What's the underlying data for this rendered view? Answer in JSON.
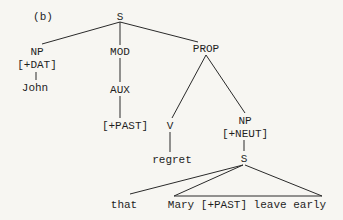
{
  "figure": {
    "panel_label": "(b)",
    "type": "syntactic-tree"
  },
  "nodes": {
    "root": {
      "label": "S",
      "x": 120,
      "y": 20
    },
    "np_dat": {
      "label": "NP",
      "x": 37,
      "y": 54
    },
    "np_dat_feat": {
      "label": "[+DAT]",
      "x": 37,
      "y": 67
    },
    "john": {
      "label": "John",
      "x": 35,
      "y": 90
    },
    "mod": {
      "label": "MOD",
      "x": 120,
      "y": 54
    },
    "aux": {
      "label": "AUX",
      "x": 120,
      "y": 92
    },
    "past": {
      "label": "[+PAST]",
      "x": 125,
      "y": 128
    },
    "prop": {
      "label": "PROP",
      "x": 206,
      "y": 50
    },
    "v": {
      "label": "V",
      "x": 170,
      "y": 128
    },
    "regret": {
      "label": "regret",
      "x": 172,
      "y": 162
    },
    "np_neut": {
      "label": "NP",
      "x": 245,
      "y": 123
    },
    "np_neut_feat": {
      "label": "[+NEUT]",
      "x": 245,
      "y": 136
    },
    "s_embedded": {
      "label": "S",
      "x": 244,
      "y": 161
    },
    "that": {
      "label": "that",
      "x": 124,
      "y": 207
    },
    "mary_clause": {
      "label": "Mary [+PAST] leave early",
      "x": 247,
      "y": 207
    }
  }
}
